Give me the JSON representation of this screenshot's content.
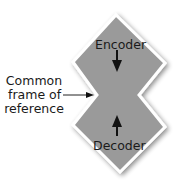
{
  "diagram": {
    "top_shape_label": "Encoder",
    "bottom_shape_label": "Decoder",
    "side_label_lines": [
      "Common",
      "frame of",
      "reference"
    ],
    "colors": {
      "shape_fill": "#9a9a9a",
      "shape_border": "#ffffff",
      "text": "#1a1a1a",
      "arrow": "#111111"
    }
  }
}
